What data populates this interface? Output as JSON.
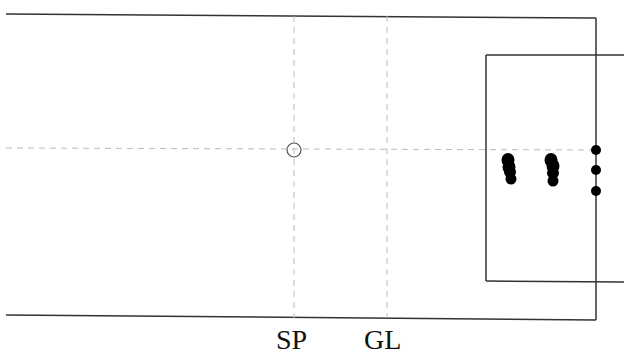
{
  "diagram": {
    "type": "pitch-diagram",
    "colors": {
      "line": "#333333",
      "dashed": "#bbbbbb",
      "player": "#000000",
      "background": "#ffffff"
    },
    "field": {
      "top_left": [
        6,
        14
      ],
      "top_right": [
        596,
        18
      ],
      "bottom_left": [
        6,
        315
      ],
      "bottom_right": [
        596,
        320
      ]
    },
    "box": {
      "left": 486,
      "top": 55,
      "bottom": 281,
      "right_extend": 624
    },
    "center_circle": {
      "cx": 294,
      "cy": 150,
      "r": 7
    },
    "midline_y": 148,
    "vertical_markers": [
      {
        "id": "SP",
        "x": 294,
        "label": "SP"
      },
      {
        "id": "GL",
        "x": 387,
        "label": "GL"
      }
    ],
    "players_cluster_1": [
      [
        508,
        158
      ],
      [
        510,
        163
      ],
      [
        509,
        170
      ],
      [
        511,
        178
      ]
    ],
    "players_cluster_2": [
      [
        551,
        158
      ],
      [
        553,
        164
      ],
      [
        552,
        171
      ],
      [
        553,
        180
      ]
    ],
    "players_goal_line": [
      [
        596,
        150
      ],
      [
        596,
        170
      ],
      [
        596,
        191
      ]
    ]
  },
  "labels": {
    "sp": "SP",
    "gl": "GL"
  }
}
